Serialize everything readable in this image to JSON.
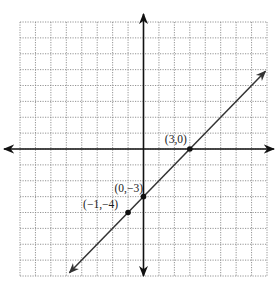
{
  "chart_data": {
    "type": "line",
    "title": "",
    "xlabel": "",
    "ylabel": "",
    "xlim": [
      -8,
      8
    ],
    "ylim": [
      -8,
      8
    ],
    "grid": true,
    "grid_style": "dotted",
    "series": [
      {
        "name": "y = x - 3",
        "slope": 1,
        "intercept": -3,
        "x": [
          -4.8,
          7.9
        ],
        "y": [
          -7.8,
          4.9
        ],
        "color": "#333333",
        "arrows": "both"
      }
    ],
    "points": [
      {
        "x": 3,
        "y": 0,
        "label": "(3,0)"
      },
      {
        "x": 0,
        "y": -3,
        "label": "(0,−3)"
      },
      {
        "x": -1,
        "y": -4,
        "label": "(−1,−4)"
      }
    ]
  },
  "colors": {
    "axis": "#111111",
    "grid": "#888888",
    "line": "#333333",
    "point": "#111111"
  }
}
